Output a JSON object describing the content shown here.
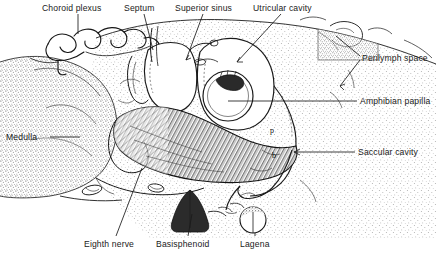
{
  "figure": {
    "kind": "anatomical-illustration",
    "background_color": "#ffffff",
    "ink_color": "#1a1a1a",
    "width": 442,
    "height": 256
  },
  "labels": [
    {
      "id": "choroid-plexus",
      "text": "Choroid plexus",
      "x": 42,
      "y": 3,
      "align": "left"
    },
    {
      "id": "septum",
      "text": "Septum",
      "x": 124,
      "y": 3,
      "align": "left"
    },
    {
      "id": "superior-sinus",
      "text": "Superior sinus",
      "x": 175,
      "y": 3,
      "align": "left"
    },
    {
      "id": "utricular-cavity",
      "text": "Utricular cavity",
      "x": 253,
      "y": 3,
      "align": "left"
    },
    {
      "id": "perilymph-space",
      "text": "Perilymph space",
      "x": 362,
      "y": 53,
      "align": "left"
    },
    {
      "id": "amphibian-papilla",
      "text": "Amphibian papilla",
      "x": 360,
      "y": 98,
      "align": "left"
    },
    {
      "id": "saccular-cavity",
      "text": "Saccular cavity",
      "x": 358,
      "y": 149,
      "align": "left"
    },
    {
      "id": "medulla",
      "text": "Medulla",
      "x": 6,
      "y": 133,
      "align": "left"
    },
    {
      "id": "eighth-nerve",
      "text": "Eighth nerve",
      "x": 84,
      "y": 240,
      "align": "left"
    },
    {
      "id": "basisphenoid",
      "text": "Basisphenoid",
      "x": 156,
      "y": 240,
      "align": "left"
    },
    {
      "id": "lagena",
      "text": "Lagena",
      "x": 240,
      "y": 240,
      "align": "left"
    }
  ],
  "interior_markers": [
    {
      "id": "marker-p",
      "text": "p",
      "x": 270,
      "y": 130
    },
    {
      "id": "marker-b",
      "text": "b",
      "x": 272,
      "y": 155
    }
  ],
  "leader_lines": [
    {
      "id": "leader-choroid-plexus",
      "from": [
        78,
        14
      ],
      "to": [
        78,
        33
      ]
    },
    {
      "id": "leader-septum",
      "from": [
        144,
        14
      ],
      "to": [
        152,
        50
      ]
    },
    {
      "id": "leader-superior-sinus",
      "from": [
        203,
        14
      ],
      "to": [
        188,
        58
      ]
    },
    {
      "id": "leader-utricular-cavity",
      "from": [
        280,
        14
      ],
      "to": [
        238,
        60
      ]
    },
    {
      "id": "leader-perilymph-space",
      "from": [
        358,
        55
      ],
      "to": [
        334,
        38
      ]
    },
    {
      "id": "leader-perilymph-space-2",
      "from": [
        358,
        58
      ],
      "to": [
        339,
        84
      ]
    },
    {
      "id": "leader-amphibian-papilla",
      "from": [
        356,
        101
      ],
      "to": [
        226,
        101
      ]
    },
    {
      "id": "leader-saccular-cavity",
      "from": [
        354,
        152
      ],
      "to": [
        292,
        152
      ]
    },
    {
      "id": "leader-medulla",
      "from": [
        50,
        137
      ],
      "to": [
        78,
        137
      ]
    },
    {
      "id": "leader-eighth-nerve",
      "from": [
        116,
        237
      ],
      "to": [
        140,
        170
      ]
    },
    {
      "id": "leader-basisphenoid",
      "from": [
        188,
        237
      ],
      "to": [
        192,
        216
      ]
    },
    {
      "id": "leader-lagena",
      "from": [
        254,
        237
      ],
      "to": [
        254,
        222
      ]
    }
  ],
  "regions": [
    {
      "id": "medulla-mass",
      "name": "medulla",
      "fill": "stipple-medium"
    },
    {
      "id": "perilymph-field",
      "name": "perilymph space",
      "fill": "stipple-light"
    },
    {
      "id": "saccular-macula",
      "name": "saccular macula",
      "fill": "hatch-dense"
    },
    {
      "id": "basisphenoid-wedge",
      "name": "basisphenoid",
      "fill": "solid-dark"
    },
    {
      "id": "superior-sinus-lumen",
      "name": "superior sinus",
      "fill": "blank"
    },
    {
      "id": "utricular-lumen",
      "name": "utricular cavity",
      "fill": "blank"
    },
    {
      "id": "amphibian-papilla-disc",
      "name": "amphibian papilla",
      "fill": "blank-outlined"
    },
    {
      "id": "lagena-disc",
      "name": "lagena",
      "fill": "stipple-ring"
    },
    {
      "id": "choroid-plexus-ribbon",
      "name": "choroid plexus",
      "fill": "outline-convoluted"
    }
  ]
}
